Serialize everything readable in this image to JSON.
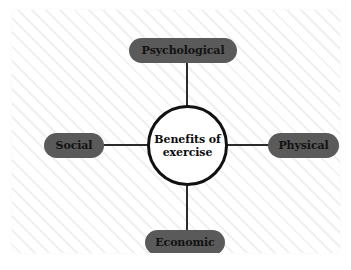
{
  "diagram": {
    "type": "mind-map",
    "center": {
      "label_line1": "Benefits of",
      "label_line2": "exercise",
      "label_full": "Benefits of exercise"
    },
    "branches": [
      {
        "id": "psychological",
        "label": "Psychological",
        "position": "top"
      },
      {
        "id": "social",
        "label": "Social",
        "position": "left"
      },
      {
        "id": "physical",
        "label": "Physical",
        "position": "right"
      },
      {
        "id": "economic",
        "label": "Economic",
        "position": "bottom"
      }
    ],
    "colors": {
      "branch_fill": "#5a5a5a",
      "branch_text": "#121212",
      "center_fill": "#ffffff",
      "center_border": "#111111",
      "center_text": "#0d0d0d",
      "connector": "#2b2b2b",
      "canvas_background": "#fefefe",
      "hatch_line": "#f0f0f0"
    }
  }
}
